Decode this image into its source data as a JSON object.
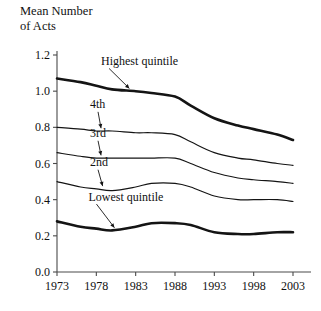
{
  "chart_data": {
    "type": "line",
    "title": "",
    "ylabel": "Mean Number\nof Acts",
    "ylabel_line1": "Mean Number",
    "ylabel_line2": "of Acts",
    "xlabel": "",
    "ylim": [
      0.0,
      1.2
    ],
    "xlim": [
      1973,
      2003
    ],
    "grid": false,
    "legend": "inline-labels",
    "ytick_labels": [
      "1.2",
      "1.0",
      "0.8",
      "0.6",
      "0.4",
      "0.2",
      "0.0"
    ],
    "ytick_values": [
      1.2,
      1.0,
      0.8,
      0.6,
      0.4,
      0.2,
      0.0
    ],
    "xtick_labels": [
      "1973",
      "1978",
      "1983",
      "1988",
      "1993",
      "1998",
      "2003"
    ],
    "xtick_values": [
      1973,
      1978,
      1983,
      1988,
      1993,
      1998,
      2003
    ],
    "x": [
      1973,
      1976,
      1978,
      1980,
      1983,
      1985,
      1988,
      1990,
      1993,
      1996,
      1998,
      2001,
      2003
    ],
    "series": [
      {
        "name": "Highest quintile",
        "label": "Highest quintile",
        "style": "thick",
        "color": "#141414",
        "values": [
          1.07,
          1.05,
          1.03,
          1.01,
          1.0,
          0.99,
          0.97,
          0.92,
          0.85,
          0.81,
          0.79,
          0.76,
          0.73
        ]
      },
      {
        "name": "4th quintile",
        "label": "4th",
        "style": "thin",
        "color": "#141414",
        "values": [
          0.8,
          0.79,
          0.78,
          0.78,
          0.77,
          0.77,
          0.76,
          0.72,
          0.66,
          0.63,
          0.62,
          0.6,
          0.59
        ]
      },
      {
        "name": "3rd quintile",
        "label": "3rd",
        "style": "thin",
        "color": "#141414",
        "values": [
          0.66,
          0.64,
          0.63,
          0.63,
          0.63,
          0.63,
          0.63,
          0.6,
          0.55,
          0.52,
          0.51,
          0.5,
          0.49
        ]
      },
      {
        "name": "2nd quintile",
        "label": "2nd",
        "style": "thin",
        "color": "#141414",
        "values": [
          0.5,
          0.47,
          0.46,
          0.45,
          0.47,
          0.49,
          0.49,
          0.47,
          0.42,
          0.4,
          0.4,
          0.4,
          0.39
        ]
      },
      {
        "name": "Lowest quintile",
        "label": "Lowest quintile",
        "style": "thick",
        "color": "#141414",
        "values": [
          0.28,
          0.25,
          0.24,
          0.23,
          0.25,
          0.27,
          0.27,
          0.26,
          0.22,
          0.21,
          0.21,
          0.22,
          0.22
        ]
      }
    ],
    "annotations": [
      {
        "text": "Highest quintile",
        "x": 1978.6,
        "y": 1.145,
        "points_to_x": 1982.2,
        "points_to_y": 1.015
      },
      {
        "text": "4th",
        "x": 1977.2,
        "y": 0.905,
        "points_to_x": 1978.6,
        "points_to_y": 0.795
      },
      {
        "text": "3rd",
        "x": 1977.2,
        "y": 0.745,
        "points_to_x": 1978.6,
        "points_to_y": 0.645
      },
      {
        "text": "2nd",
        "x": 1977.2,
        "y": 0.585,
        "points_to_x": 1978.8,
        "points_to_y": 0.475
      },
      {
        "text": "Lowest quintile",
        "x": 1977.0,
        "y": 0.395,
        "points_to_x": 1980.3,
        "points_to_y": 0.245
      }
    ]
  }
}
